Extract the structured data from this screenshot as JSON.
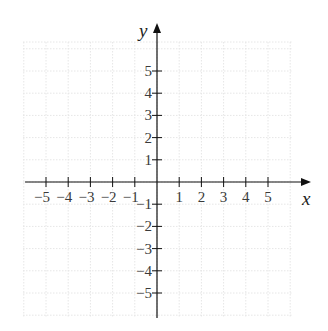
{
  "chart_data": {
    "type": "line",
    "title": "",
    "xlabel": "x",
    "ylabel": "y",
    "xlim": [
      -6,
      7
    ],
    "ylim": [
      -6,
      7
    ],
    "grid": true,
    "grid_style": "faint dotted",
    "legend": null,
    "x_ticks": [
      -5,
      -4,
      -3,
      -2,
      -1,
      1,
      2,
      3,
      4,
      5
    ],
    "y_ticks": [
      -5,
      -4,
      -3,
      -2,
      -1,
      1,
      2,
      3,
      4,
      5
    ],
    "x_tick_labels": [
      "−5",
      "−4",
      "−3",
      "−2",
      "−1",
      "1",
      "2",
      "3",
      "4",
      "5"
    ],
    "y_tick_labels": [
      "−5",
      "−4",
      "−3",
      "−2",
      "−1",
      "1",
      "2",
      "3",
      "4",
      "5"
    ],
    "series": []
  },
  "axes": {
    "x_label": "x",
    "y_label": "y"
  },
  "colors": {
    "axis": "#111111",
    "grid": "#e6e6e6",
    "text": "#3a3a3a"
  }
}
